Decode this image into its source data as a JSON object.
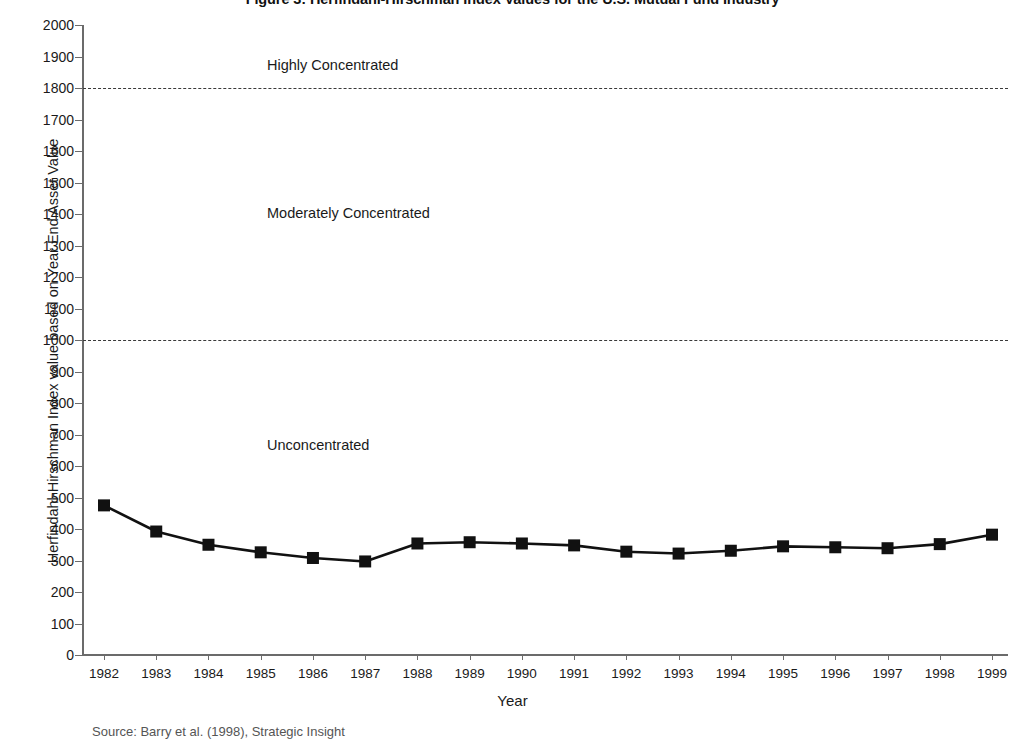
{
  "figure": {
    "title": "Figure 3: Herfindahl-Hirschman Index Values for the U.S. Mutual Fund Industry",
    "source_note": "Source: Barry et al. (1998), Strategic Insight"
  },
  "chart_data": {
    "type": "line",
    "title": "Figure 3: Herfindahl-Hirschman Index Values for the U.S. Mutual Fund Industry",
    "xlabel": "Year",
    "ylabel": "Herfindahl-Hirschman Index value based on Year End Asset Value",
    "categories": [
      "1982",
      "1983",
      "1984",
      "1985",
      "1986",
      "1987",
      "1988",
      "1989",
      "1990",
      "1991",
      "1992",
      "1993",
      "1994",
      "1995",
      "1996",
      "1997",
      "1998",
      "1999"
    ],
    "values": [
      475,
      392,
      350,
      326,
      308,
      297,
      354,
      358,
      354,
      348,
      328,
      322,
      331,
      345,
      342,
      339,
      352,
      382
    ],
    "series": [
      {
        "name": "Herfindahl-Hirschman Index",
        "values": [
          475,
          392,
          350,
          326,
          308,
          297,
          354,
          358,
          354,
          348,
          328,
          322,
          331,
          345,
          342,
          339,
          352,
          382
        ]
      }
    ],
    "ylim": [
      0,
      2000
    ],
    "ytick_step": 100,
    "yticks": [
      0,
      100,
      200,
      300,
      400,
      500,
      600,
      700,
      800,
      900,
      1000,
      1100,
      1200,
      1300,
      1400,
      1500,
      1600,
      1700,
      1800,
      1900,
      2000
    ],
    "ytick_labels": [
      "0",
      "100",
      "200",
      "300",
      "400",
      "500",
      "600",
      "700",
      "800",
      "900",
      "1000",
      "1100",
      "1200",
      "1300",
      "1400",
      "1500",
      "1600",
      "1700",
      "1800",
      "1900",
      "2000"
    ],
    "grid": false,
    "legend": "none",
    "marker": "square",
    "line_color": "#111111",
    "marker_color": "#111111",
    "threshold_lines": [
      {
        "value": 1800,
        "style": "dashed",
        "color": "#3a3a3a"
      },
      {
        "value": 1000,
        "style": "dashed",
        "color": "#3a3a3a"
      }
    ],
    "annotations": [
      {
        "text": "Highly Concentrated",
        "x_year": "1985",
        "y_value": 1900
      },
      {
        "text": "Moderately Concentrated",
        "x_year": "1985",
        "y_value": 1400
      },
      {
        "text": "Unconcentrated",
        "x_year": "1985",
        "y_value": 650
      }
    ]
  },
  "axes": {
    "x_title": "Year",
    "y_title": "Herfindahl-Hirschman Index value based on Year End Asset Value"
  },
  "zones": {
    "highly": "Highly Concentrated",
    "moderately": "Moderately Concentrated",
    "unconcentrated": "Unconcentrated"
  },
  "colors": {
    "series": "#111111",
    "axis": "#6b6b6b",
    "threshold": "#3a3a3a",
    "text": "#1a1a1a",
    "background": "#ffffff"
  }
}
